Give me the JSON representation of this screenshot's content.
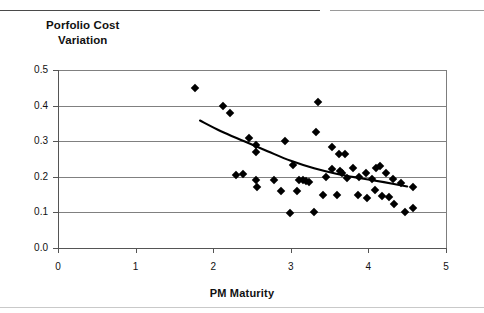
{
  "title_line1": "Porfolio Cost",
  "title_line2": "Variation",
  "axis": {
    "x_label": "PM Maturity",
    "y_ticks": [
      "0.0",
      "0.1",
      "0.2",
      "0.3",
      "0.4",
      "0.5"
    ],
    "x_ticks": [
      "0",
      "1",
      "2",
      "3",
      "4",
      "5"
    ]
  },
  "chart_data": {
    "type": "scatter",
    "title": "Porfolio Cost Variation",
    "xlabel": "PM Maturity",
    "ylabel": "Porfolio Cost Variation",
    "xlim": [
      0,
      5
    ],
    "ylim": [
      0.0,
      0.5
    ],
    "xticks": [
      0,
      1,
      2,
      3,
      4,
      5
    ],
    "yticks": [
      0.0,
      0.1,
      0.2,
      0.3,
      0.4,
      0.5
    ],
    "grid": "horizontal",
    "legend": "none",
    "marker": "filled-diamond",
    "marker_color": "#000000",
    "points": [
      {
        "x": 1.77,
        "y": 0.45
      },
      {
        "x": 2.12,
        "y": 0.4
      },
      {
        "x": 2.22,
        "y": 0.38
      },
      {
        "x": 2.46,
        "y": 0.31
      },
      {
        "x": 2.55,
        "y": 0.29
      },
      {
        "x": 2.93,
        "y": 0.3
      },
      {
        "x": 2.55,
        "y": 0.27
      },
      {
        "x": 2.38,
        "y": 0.207
      },
      {
        "x": 2.3,
        "y": 0.205
      },
      {
        "x": 2.55,
        "y": 0.19
      },
      {
        "x": 2.56,
        "y": 0.17
      },
      {
        "x": 2.78,
        "y": 0.19
      },
      {
        "x": 3.03,
        "y": 0.232
      },
      {
        "x": 3.11,
        "y": 0.19
      },
      {
        "x": 3.16,
        "y": 0.19
      },
      {
        "x": 3.2,
        "y": 0.187
      },
      {
        "x": 3.23,
        "y": 0.185
      },
      {
        "x": 3.3,
        "y": 0.1
      },
      {
        "x": 2.99,
        "y": 0.098
      },
      {
        "x": 3.35,
        "y": 0.41
      },
      {
        "x": 3.33,
        "y": 0.325
      },
      {
        "x": 3.53,
        "y": 0.285
      },
      {
        "x": 3.62,
        "y": 0.265
      },
      {
        "x": 3.7,
        "y": 0.265
      },
      {
        "x": 3.45,
        "y": 0.2
      },
      {
        "x": 3.53,
        "y": 0.222
      },
      {
        "x": 3.64,
        "y": 0.215
      },
      {
        "x": 3.66,
        "y": 0.212
      },
      {
        "x": 3.72,
        "y": 0.197
      },
      {
        "x": 3.8,
        "y": 0.225
      },
      {
        "x": 3.88,
        "y": 0.2
      },
      {
        "x": 3.97,
        "y": 0.212
      },
      {
        "x": 4.04,
        "y": 0.195
      },
      {
        "x": 4.1,
        "y": 0.225
      },
      {
        "x": 4.15,
        "y": 0.23
      },
      {
        "x": 4.23,
        "y": 0.21
      },
      {
        "x": 4.32,
        "y": 0.195
      },
      {
        "x": 4.42,
        "y": 0.182
      },
      {
        "x": 4.57,
        "y": 0.17
      },
      {
        "x": 3.42,
        "y": 0.15
      },
      {
        "x": 3.6,
        "y": 0.15
      },
      {
        "x": 3.86,
        "y": 0.15
      },
      {
        "x": 4.08,
        "y": 0.162
      },
      {
        "x": 4.18,
        "y": 0.145
      },
      {
        "x": 4.26,
        "y": 0.142
      },
      {
        "x": 4.33,
        "y": 0.125
      },
      {
        "x": 4.47,
        "y": 0.1
      },
      {
        "x": 4.57,
        "y": 0.112
      },
      {
        "x": 3.98,
        "y": 0.14
      },
      {
        "x": 2.87,
        "y": 0.16
      },
      {
        "x": 3.08,
        "y": 0.16
      }
    ],
    "trend": {
      "type": "fitted-curve",
      "color": "#000000",
      "points": [
        {
          "x": 1.83,
          "y": 0.358
        },
        {
          "x": 2.1,
          "y": 0.328
        },
        {
          "x": 2.4,
          "y": 0.3
        },
        {
          "x": 2.7,
          "y": 0.272
        },
        {
          "x": 3.0,
          "y": 0.245
        },
        {
          "x": 3.3,
          "y": 0.224
        },
        {
          "x": 3.6,
          "y": 0.208
        },
        {
          "x": 3.9,
          "y": 0.196
        },
        {
          "x": 4.2,
          "y": 0.185
        },
        {
          "x": 4.5,
          "y": 0.173
        }
      ]
    }
  }
}
